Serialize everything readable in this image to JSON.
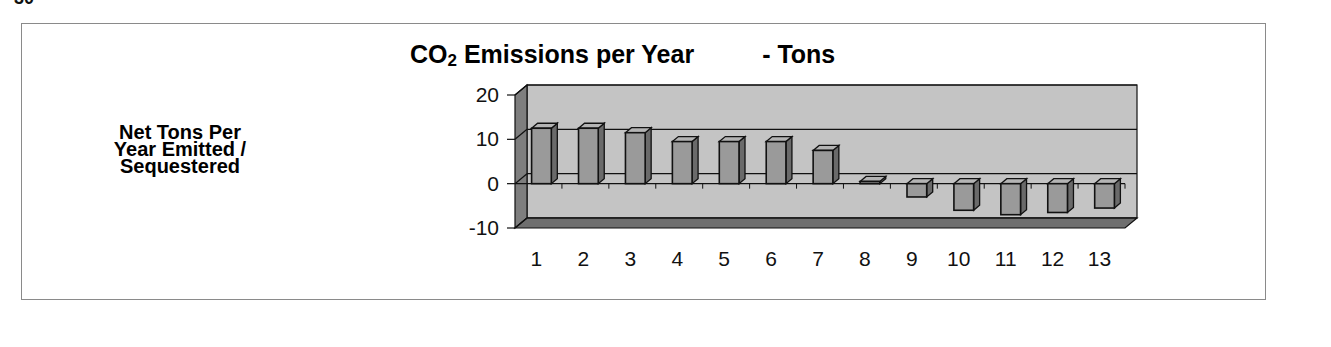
{
  "page": {
    "fragment": "30"
  },
  "chart_data": {
    "type": "bar",
    "style": "3d-column",
    "title_parts": {
      "main": "CO",
      "subscript": "2",
      "rest": " Emissions per Year",
      "suffix": "- Tons"
    },
    "xlabel": "",
    "ylabel": "Net Tons Per Year Emitted / Sequestered",
    "ylabel_lines": [
      "Net Tons Per",
      "Year Emitted /",
      "Sequestered"
    ],
    "categories": [
      "1",
      "2",
      "3",
      "4",
      "5",
      "6",
      "7",
      "8",
      "9",
      "10",
      "11",
      "12",
      "13"
    ],
    "values": [
      12.5,
      12.5,
      11.5,
      9.5,
      9.5,
      9.5,
      7.5,
      0.5,
      -3,
      -6,
      -7,
      -6.5,
      -5.5
    ],
    "ylim": [
      -10,
      20
    ],
    "yticks": [
      "20",
      "10",
      "0",
      "-10"
    ],
    "grid": true,
    "legend": null,
    "colors": {
      "wall": "#c4c4c4",
      "side_wall": "#7e7e7e",
      "floor": "#6f6f6f",
      "bar_front": "#9a9a9a",
      "bar_side": "#6a6a6a",
      "bar_top": "#b4b4b4",
      "edge": "#111111"
    }
  }
}
